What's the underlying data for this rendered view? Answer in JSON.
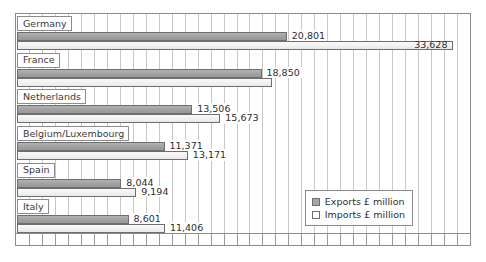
{
  "chart_data": {
    "type": "bar",
    "orientation": "horizontal",
    "title": "",
    "xlabel": "",
    "ylabel": "",
    "xlim": [
      0,
      35000
    ],
    "grid": true,
    "grid_step": 1000,
    "legend_position": "bottom-right",
    "categories": [
      "Germany",
      "France",
      "Netherlands",
      "Belgium/Luxembourg",
      "Spain",
      "Italy"
    ],
    "series": [
      {
        "name": "Exports £ million",
        "color": "#a6a6a6",
        "values": [
          20801,
          18850,
          13506,
          11371,
          8044,
          8601
        ],
        "labels": [
          "20,801",
          "18,850",
          "13,506",
          "11,371",
          "8,044",
          "8,601"
        ]
      },
      {
        "name": "Imports £ million",
        "color": "#ffffff",
        "values": [
          33628,
          19650,
          15673,
          13171,
          9194,
          11406
        ],
        "labels": [
          "33,628",
          "",
          "15,673",
          "13,171",
          "9,194",
          "11,406"
        ]
      }
    ]
  },
  "legend": {
    "entries": [
      {
        "label": "Exports £ million"
      },
      {
        "label": "Imports £ million"
      }
    ]
  },
  "groups": [
    {
      "name": "Germany",
      "export_label": "20,801",
      "import_label": "33,628"
    },
    {
      "name": "France",
      "export_label": "18,850",
      "import_label": ""
    },
    {
      "name": "Netherlands",
      "export_label": "13,506",
      "import_label": "15,673"
    },
    {
      "name": "Belgium/Luxembourg",
      "export_label": "11,371",
      "import_label": "13,171"
    },
    {
      "name": "Spain",
      "export_label": "8,044",
      "import_label": "9,194"
    },
    {
      "name": "Italy",
      "export_label": "8,601",
      "import_label": "11,406"
    }
  ]
}
